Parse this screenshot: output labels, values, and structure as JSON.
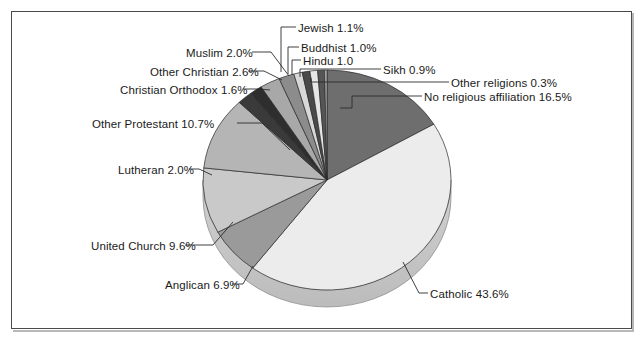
{
  "chart_data": {
    "type": "pie",
    "title": "",
    "subtitle": "",
    "xlabel": "",
    "ylabel": "",
    "legend_position": "callout-labels",
    "grid": false,
    "style": "3d-pie-greyscale",
    "start_angle_deg": 0,
    "direction": "clockwise",
    "categories": [
      "No religious affiliation",
      "Catholic",
      "Anglican",
      "United Church",
      "Other Protestant",
      "Lutheran",
      "Christian Orthodox",
      "Other Christian",
      "Muslim",
      "Jewish",
      "Buddhist",
      "Hindu",
      "Sikh",
      "Other religions"
    ],
    "values": [
      16.5,
      43.6,
      6.9,
      9.6,
      10.7,
      2.0,
      1.6,
      2.6,
      2.0,
      1.1,
      1.0,
      1.0,
      0.9,
      0.3
    ],
    "value_suffix": "%",
    "slices": [
      {
        "label": "No religious affiliation",
        "value": 16.5,
        "text": "No religious affiliation 16.5%",
        "color": "#6e6e6e"
      },
      {
        "label": "Catholic",
        "value": 43.6,
        "text": "Catholic  43.6%",
        "color": "#ececec"
      },
      {
        "label": "Anglican",
        "value": 6.9,
        "text": "Anglican 6.9%",
        "color": "#9a9a9a"
      },
      {
        "label": "United Church",
        "value": 9.6,
        "text": "United Church 9.6%",
        "color": "#c9c9c9"
      },
      {
        "label": "Other Protestant",
        "value": 10.7,
        "text": "Other Protestant 10.7%",
        "color": "#b5b5b5"
      },
      {
        "label": "Lutheran",
        "value": 2.0,
        "text": "Lutheran 2.0%",
        "color": "#3a3a3a"
      },
      {
        "label": "Christian Orthodox",
        "value": 1.6,
        "text": "Christian Orthodox 1.6%",
        "color": "#2e2e2e"
      },
      {
        "label": "Other Christian",
        "value": 2.6,
        "text": "Other Christian 2.6%",
        "color": "#a8a8a8"
      },
      {
        "label": "Muslim",
        "value": 2.0,
        "text": "Muslim 2.0%",
        "color": "#8c8c8c"
      },
      {
        "label": "Jewish",
        "value": 1.1,
        "text": "Jewish 1.1%",
        "color": "#d8d8d8"
      },
      {
        "label": "Buddhist",
        "value": 1.0,
        "text": "Buddhist 1.0%",
        "color": "#4a4a4a"
      },
      {
        "label": "Hindu",
        "value": 1.0,
        "text": "Hindu 1.0",
        "color": "#e6e6e6"
      },
      {
        "label": "Sikh",
        "value": 0.9,
        "text": "Sikh 0.9%",
        "color": "#555555"
      },
      {
        "label": "Other religions",
        "value": 0.3,
        "text": "Other religions  0.3%",
        "color": "#bdbdbd"
      }
    ]
  },
  "labels": {
    "jewish": "Jewish 1.1%",
    "buddhist": "Buddhist 1.0%",
    "hindu": "Hindu 1.0",
    "sikh": "Sikh 0.9%",
    "other_religions": "Other religions  0.3%",
    "no_religious_affiliation": "No religious affiliation 16.5%",
    "muslim": "Muslim 2.0%",
    "other_christian": "Other Christian 2.6%",
    "christian_orthodox": "Christian Orthodox 1.6%",
    "other_protestant": "Other Protestant 10.7%",
    "lutheran": "Lutheran 2.0%",
    "united_church": "United Church 9.6%",
    "anglican": "Anglican 6.9%",
    "catholic": "Catholic  43.6%"
  },
  "colors": {
    "frame_border": "#4a4a4a",
    "background": "#ffffff",
    "text": "#1a1a1a",
    "leader_line": "#2b2b2b"
  }
}
